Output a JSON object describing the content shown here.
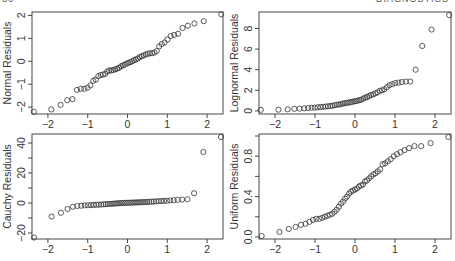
{
  "header": {
    "page_number": "66",
    "section": "DIAGNOSTICS"
  },
  "chart_data": [
    {
      "type": "scatter",
      "title": "",
      "xlabel": "",
      "ylabel": "Normal Residuals",
      "xlim": [
        -2.4,
        2.4
      ],
      "ylim": [
        -2.3,
        2.15
      ],
      "xticks": [
        -2,
        -1,
        0,
        1,
        2
      ],
      "yticks": [
        -2,
        -1,
        0,
        1,
        2
      ],
      "ytick_labels": [
        "−2",
        "−1",
        "0",
        "1",
        "2"
      ],
      "frame": {
        "x0": 32,
        "y0": 12,
        "x1": 223,
        "y1": 114
      },
      "values": [
        -2.2,
        -2.1,
        -1.9,
        -1.7,
        -1.65,
        -1.25,
        -1.2,
        -1.2,
        -1.15,
        -1.05,
        -0.85,
        -0.8,
        -0.65,
        -0.6,
        -0.58,
        -0.55,
        -0.45,
        -0.4,
        -0.4,
        -0.38,
        -0.35,
        -0.32,
        -0.28,
        -0.22,
        -0.18,
        -0.15,
        -0.1,
        -0.07,
        -0.04,
        0.0,
        0.05,
        0.08,
        0.12,
        0.18,
        0.22,
        0.25,
        0.3,
        0.32,
        0.35,
        0.35,
        0.38,
        0.45,
        0.65,
        0.75,
        0.82,
        0.95,
        1.1,
        1.15,
        1.2,
        1.45,
        1.55,
        1.65,
        1.75,
        2.05
      ]
    },
    {
      "type": "scatter",
      "title": "",
      "xlabel": "",
      "ylabel": "Lognormal Residuals",
      "xlim": [
        -2.4,
        2.4
      ],
      "ylim": [
        -0.3,
        9.6
      ],
      "xticks": [
        -2,
        -1,
        0,
        1,
        2
      ],
      "yticks": [
        0,
        2,
        4,
        6,
        8
      ],
      "ytick_labels": [
        "0",
        "2",
        "4",
        "6",
        "8"
      ],
      "frame": {
        "x0": 259,
        "y0": 12,
        "x1": 451,
        "y1": 114
      },
      "values": [
        0.1,
        0.12,
        0.15,
        0.2,
        0.22,
        0.25,
        0.28,
        0.3,
        0.32,
        0.35,
        0.38,
        0.4,
        0.42,
        0.45,
        0.48,
        0.5,
        0.55,
        0.6,
        0.62,
        0.65,
        0.7,
        0.75,
        0.78,
        0.8,
        0.85,
        0.88,
        0.92,
        0.95,
        1.0,
        1.05,
        1.1,
        1.2,
        1.3,
        1.35,
        1.45,
        1.55,
        1.6,
        1.7,
        1.8,
        1.95,
        2.0,
        2.1,
        2.3,
        2.5,
        2.6,
        2.7,
        2.75,
        2.8,
        2.85,
        2.85,
        4.0,
        6.3,
        7.9,
        9.3
      ]
    },
    {
      "type": "scatter",
      "title": "",
      "xlabel": "",
      "ylabel": "Cauchy Residuals",
      "xlim": [
        -2.4,
        2.4
      ],
      "ylim": [
        -24,
        46
      ],
      "xticks": [
        -2,
        -1,
        0,
        1,
        2
      ],
      "yticks": [
        -20,
        -10,
        0,
        10,
        20,
        30,
        40
      ],
      "ytick_labels": [
        "−20",
        "",
        "0",
        "",
        "20",
        "",
        "40"
      ],
      "frame": {
        "x0": 32,
        "y0": 134,
        "x1": 223,
        "y1": 239
      },
      "values": [
        -23,
        -9,
        -6.5,
        -4,
        -2.5,
        -2,
        -1.8,
        -1.6,
        -1.5,
        -1.4,
        -1.3,
        -1.2,
        -1.1,
        -1.0,
        -0.9,
        -0.8,
        -0.7,
        -0.6,
        -0.5,
        -0.4,
        -0.3,
        -0.2,
        -0.1,
        0.0,
        0.05,
        0.1,
        0.15,
        0.2,
        0.25,
        0.3,
        0.35,
        0.4,
        0.45,
        0.5,
        0.55,
        0.6,
        0.7,
        0.8,
        0.9,
        1.0,
        1.1,
        1.2,
        1.3,
        1.4,
        1.5,
        1.7,
        1.9,
        2.1,
        2.3,
        2.5,
        6.5,
        34,
        44
      ]
    },
    {
      "type": "scatter",
      "title": "",
      "xlabel": "",
      "ylabel": "Uniform Residuals",
      "xlim": [
        -2.4,
        2.4
      ],
      "ylim": [
        -0.02,
        1.02
      ],
      "xticks": [
        -2,
        -1,
        0,
        1,
        2
      ],
      "yticks": [
        0.0,
        0.2,
        0.4,
        0.6,
        0.8,
        1.0
      ],
      "ytick_labels": [
        "0.0",
        "",
        "0.4",
        "",
        "0.8",
        ""
      ],
      "frame": {
        "x0": 259,
        "y0": 134,
        "x1": 451,
        "y1": 239
      },
      "values": [
        0.01,
        0.05,
        0.08,
        0.1,
        0.12,
        0.13,
        0.15,
        0.17,
        0.18,
        0.18,
        0.19,
        0.2,
        0.21,
        0.22,
        0.23,
        0.25,
        0.27,
        0.3,
        0.33,
        0.35,
        0.38,
        0.4,
        0.43,
        0.45,
        0.46,
        0.47,
        0.48,
        0.5,
        0.51,
        0.52,
        0.55,
        0.56,
        0.58,
        0.6,
        0.62,
        0.63,
        0.65,
        0.67,
        0.72,
        0.73,
        0.75,
        0.77,
        0.8,
        0.82,
        0.84,
        0.86,
        0.88,
        0.9,
        0.9,
        0.93,
        0.99
      ]
    }
  ]
}
